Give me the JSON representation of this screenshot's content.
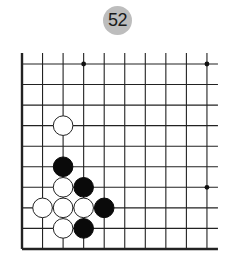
{
  "problem": {
    "number_label": "52",
    "badge_color": "#bdbdbd"
  },
  "board": {
    "origin_x": 22,
    "origin_y": 64,
    "spacing": 20.55,
    "columns": 10,
    "rows": 10,
    "left_edge": true,
    "bottom_edge": true,
    "top_open": true,
    "right_open": true,
    "line_color": "#222222",
    "star_points": [
      {
        "col": 3,
        "row": 0
      },
      {
        "col": 9,
        "row": 0
      },
      {
        "col": 9,
        "row": 6
      }
    ],
    "stones": [
      {
        "color": "white",
        "col": 2,
        "row": 3
      },
      {
        "color": "black",
        "col": 2,
        "row": 5
      },
      {
        "color": "white",
        "col": 2,
        "row": 6
      },
      {
        "color": "black",
        "col": 3,
        "row": 6
      },
      {
        "color": "white",
        "col": 1,
        "row": 7
      },
      {
        "color": "white",
        "col": 2,
        "row": 7
      },
      {
        "color": "white",
        "col": 3,
        "row": 7
      },
      {
        "color": "black",
        "col": 4,
        "row": 7
      },
      {
        "color": "white",
        "col": 2,
        "row": 8
      },
      {
        "color": "black",
        "col": 3,
        "row": 8
      }
    ]
  }
}
